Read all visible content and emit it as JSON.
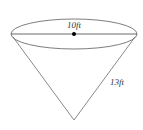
{
  "diagram": {
    "type": "cone",
    "labels": {
      "diameter": "10ft",
      "slant_height": "13ft"
    },
    "colors": {
      "stroke": "#6e6e6e",
      "dot": "#000000",
      "text": "#333333",
      "background": "#ffffff"
    }
  }
}
